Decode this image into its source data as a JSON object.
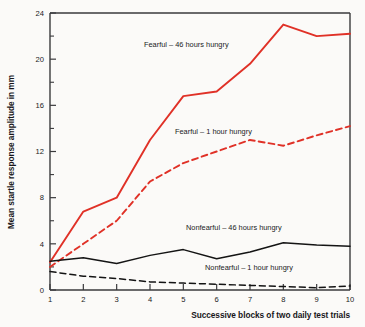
{
  "chart_data": {
    "type": "line",
    "title": "",
    "xlabel": "Successive blocks of two daily test trials",
    "ylabel": "Mean startle response amplitude in mm",
    "x": [
      1,
      2,
      3,
      4,
      5,
      6,
      7,
      8,
      9,
      10
    ],
    "xtick_labels": [
      "1",
      "2",
      "3",
      "4",
      "5",
      "6",
      "7",
      "8",
      "9",
      "10"
    ],
    "ytick_labels": [
      "0",
      "4",
      "8",
      "12",
      "16",
      "20",
      "24"
    ],
    "ytick_values": [
      0,
      4,
      8,
      12,
      16,
      20,
      24
    ],
    "yminor_values": [
      2,
      6,
      10,
      14,
      18,
      22
    ],
    "xlim": [
      1,
      10
    ],
    "ylim": [
      0,
      24
    ],
    "grid": false,
    "legend_position": "inline-annotations",
    "series": [
      {
        "name": "Fearful – 46 hours hungry",
        "color": "#e03127",
        "style": "solid",
        "values": [
          2.4,
          6.8,
          8.0,
          13.0,
          16.8,
          17.2,
          19.6,
          23.0,
          22.0,
          22.2
        ]
      },
      {
        "name": "Fearful – 1 hour hungry",
        "color": "#e03127",
        "style": "dashed",
        "values": [
          2.0,
          4.0,
          6.0,
          9.4,
          11.0,
          12.0,
          13.0,
          12.5,
          13.4,
          14.2
        ]
      },
      {
        "name": "Nonfearful – 46 hours hungry",
        "color": "#141414",
        "style": "solid",
        "values": [
          2.5,
          2.8,
          2.3,
          3.0,
          3.5,
          2.7,
          3.3,
          4.1,
          3.9,
          3.8
        ]
      },
      {
        "name": "Nonfearful – 1 hour hungry",
        "color": "#141414",
        "style": "dashed",
        "values": [
          1.6,
          1.2,
          1.0,
          0.7,
          0.6,
          0.5,
          0.4,
          0.3,
          0.2,
          0.35
        ]
      }
    ],
    "annotations": [
      {
        "text": "Fearful – 46 hours hungry",
        "x": 144,
        "y": 47,
        "color": "#1a1a1c"
      },
      {
        "text": "Fearful – 1 hour hungry",
        "x": 175,
        "y": 134,
        "color": "#1a1a1c"
      },
      {
        "text": "Nonfearful – 46 hours hungry",
        "x": 186,
        "y": 230,
        "color": "#1a1a1c"
      },
      {
        "text": "Nonfearful – 1 hour hungry",
        "x": 205,
        "y": 270,
        "color": "#1a1a1c"
      }
    ]
  },
  "axes": {
    "y_axis_title": "Mean startle response amplitude in mm",
    "x_axis_title": "Successive blocks of two daily test trials"
  },
  "colors": {
    "fearful": "#e03127",
    "nonfearful": "#141414",
    "axis": "#3a3a3c",
    "background": "#fbfaf8"
  }
}
